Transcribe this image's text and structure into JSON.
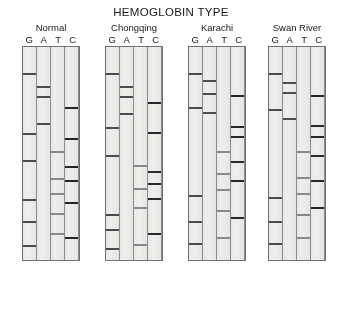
{
  "figure": {
    "title": "HEMOGLOBIN TYPE"
  },
  "lane_labels": [
    "G",
    "A",
    "T",
    "C"
  ],
  "panels": [
    {
      "name": "Normal",
      "x": 22,
      "width": 58,
      "lanes": [
        {
          "base": "G",
          "bands": [
            {
              "y": 26,
              "h": 2.0,
              "tone": "mid"
            },
            {
              "y": 86,
              "h": 2.0,
              "tone": "mid"
            },
            {
              "y": 113,
              "h": 2.0,
              "tone": "mid"
            },
            {
              "y": 152,
              "h": 2.0,
              "tone": "mid"
            },
            {
              "y": 174,
              "h": 2.0,
              "tone": "mid"
            },
            {
              "y": 198,
              "h": 2.0,
              "tone": "mid"
            }
          ]
        },
        {
          "base": "A",
          "bands": [
            {
              "y": 39,
              "h": 2.0,
              "tone": "mid"
            },
            {
              "y": 49,
              "h": 2.0,
              "tone": "mid"
            },
            {
              "y": 76,
              "h": 2.0,
              "tone": "mid"
            }
          ]
        },
        {
          "base": "T",
          "bands": [
            {
              "y": 104,
              "h": 2.0,
              "tone": "faint"
            },
            {
              "y": 131,
              "h": 2.0,
              "tone": "faint"
            },
            {
              "y": 146,
              "h": 2.0,
              "tone": "faint"
            },
            {
              "y": 166,
              "h": 2.0,
              "tone": "faint"
            },
            {
              "y": 186,
              "h": 2.0,
              "tone": "faint"
            }
          ]
        },
        {
          "base": "C",
          "bands": [
            {
              "y": 60,
              "h": 2.4,
              "tone": "dark"
            },
            {
              "y": 91,
              "h": 2.4,
              "tone": "dark"
            },
            {
              "y": 119,
              "h": 2.4,
              "tone": "dark"
            },
            {
              "y": 133,
              "h": 2.4,
              "tone": "dark"
            },
            {
              "y": 155,
              "h": 2.4,
              "tone": "dark"
            },
            {
              "y": 190,
              "h": 2.4,
              "tone": "dark"
            }
          ]
        }
      ]
    },
    {
      "name": "Chongqing",
      "x": 105,
      "width": 58,
      "lanes": [
        {
          "base": "G",
          "bands": [
            {
              "y": 26,
              "h": 2.0,
              "tone": "mid"
            },
            {
              "y": 80,
              "h": 2.0,
              "tone": "mid"
            },
            {
              "y": 108,
              "h": 2.0,
              "tone": "mid"
            },
            {
              "y": 167,
              "h": 2.0,
              "tone": "mid"
            },
            {
              "y": 182,
              "h": 2.0,
              "tone": "mid"
            },
            {
              "y": 201,
              "h": 2.0,
              "tone": "mid"
            }
          ]
        },
        {
          "base": "A",
          "bands": [
            {
              "y": 39,
              "h": 2.0,
              "tone": "mid"
            },
            {
              "y": 49,
              "h": 2.0,
              "tone": "mid"
            },
            {
              "y": 66,
              "h": 2.0,
              "tone": "mid"
            }
          ]
        },
        {
          "base": "T",
          "bands": [
            {
              "y": 118,
              "h": 2.0,
              "tone": "faint"
            },
            {
              "y": 141,
              "h": 2.0,
              "tone": "faint"
            },
            {
              "y": 160,
              "h": 2.0,
              "tone": "faint"
            },
            {
              "y": 197,
              "h": 2.0,
              "tone": "faint"
            }
          ]
        },
        {
          "base": "C",
          "bands": [
            {
              "y": 55,
              "h": 2.4,
              "tone": "dark"
            },
            {
              "y": 85,
              "h": 2.4,
              "tone": "dark"
            },
            {
              "y": 124,
              "h": 2.4,
              "tone": "dark"
            },
            {
              "y": 136,
              "h": 2.4,
              "tone": "dark"
            },
            {
              "y": 151,
              "h": 2.4,
              "tone": "dark"
            },
            {
              "y": 186,
              "h": 2.4,
              "tone": "dark"
            }
          ]
        }
      ]
    },
    {
      "name": "Karachi",
      "x": 188,
      "width": 58,
      "lanes": [
        {
          "base": "G",
          "bands": [
            {
              "y": 26,
              "h": 2.0,
              "tone": "mid"
            },
            {
              "y": 60,
              "h": 2.0,
              "tone": "mid"
            },
            {
              "y": 148,
              "h": 2.0,
              "tone": "mid"
            },
            {
              "y": 174,
              "h": 2.0,
              "tone": "mid"
            },
            {
              "y": 196,
              "h": 2.0,
              "tone": "mid"
            }
          ]
        },
        {
          "base": "A",
          "bands": [
            {
              "y": 33,
              "h": 2.0,
              "tone": "mid"
            },
            {
              "y": 46,
              "h": 2.0,
              "tone": "mid"
            },
            {
              "y": 65,
              "h": 2.0,
              "tone": "mid"
            }
          ]
        },
        {
          "base": "T",
          "bands": [
            {
              "y": 104,
              "h": 2.0,
              "tone": "faint"
            },
            {
              "y": 126,
              "h": 2.0,
              "tone": "faint"
            },
            {
              "y": 142,
              "h": 2.0,
              "tone": "faint"
            },
            {
              "y": 163,
              "h": 2.0,
              "tone": "faint"
            },
            {
              "y": 190,
              "h": 2.0,
              "tone": "faint"
            }
          ]
        },
        {
          "base": "C",
          "bands": [
            {
              "y": 48,
              "h": 2.4,
              "tone": "dark"
            },
            {
              "y": 79,
              "h": 2.4,
              "tone": "dark"
            },
            {
              "y": 89,
              "h": 2.4,
              "tone": "dark"
            },
            {
              "y": 114,
              "h": 2.4,
              "tone": "dark"
            },
            {
              "y": 133,
              "h": 2.4,
              "tone": "dark"
            },
            {
              "y": 170,
              "h": 2.4,
              "tone": "dark"
            }
          ]
        }
      ]
    },
    {
      "name": "Swan River",
      "x": 268,
      "width": 58,
      "lanes": [
        {
          "base": "G",
          "bands": [
            {
              "y": 26,
              "h": 2.0,
              "tone": "mid"
            },
            {
              "y": 62,
              "h": 2.0,
              "tone": "mid"
            },
            {
              "y": 150,
              "h": 2.0,
              "tone": "mid"
            },
            {
              "y": 174,
              "h": 2.0,
              "tone": "mid"
            },
            {
              "y": 196,
              "h": 2.0,
              "tone": "mid"
            }
          ]
        },
        {
          "base": "A",
          "bands": [
            {
              "y": 35,
              "h": 2.0,
              "tone": "mid"
            },
            {
              "y": 45,
              "h": 2.0,
              "tone": "mid"
            },
            {
              "y": 71,
              "h": 2.0,
              "tone": "mid"
            }
          ]
        },
        {
          "base": "T",
          "bands": [
            {
              "y": 104,
              "h": 2.0,
              "tone": "faint"
            },
            {
              "y": 130,
              "h": 2.0,
              "tone": "faint"
            },
            {
              "y": 146,
              "h": 2.0,
              "tone": "faint"
            },
            {
              "y": 167,
              "h": 2.0,
              "tone": "faint"
            },
            {
              "y": 190,
              "h": 2.0,
              "tone": "faint"
            }
          ]
        },
        {
          "base": "C",
          "bands": [
            {
              "y": 48,
              "h": 2.4,
              "tone": "dark"
            },
            {
              "y": 78,
              "h": 2.4,
              "tone": "dark"
            },
            {
              "y": 89,
              "h": 2.4,
              "tone": "dark"
            },
            {
              "y": 108,
              "h": 2.4,
              "tone": "dark"
            },
            {
              "y": 133,
              "h": 2.4,
              "tone": "dark"
            },
            {
              "y": 160,
              "h": 2.4,
              "tone": "dark"
            }
          ]
        }
      ]
    }
  ]
}
